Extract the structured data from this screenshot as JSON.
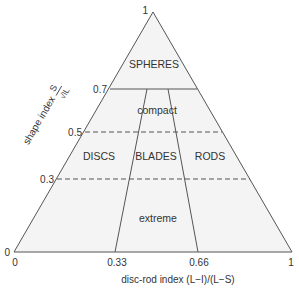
{
  "diagram": {
    "colors": {
      "fill": "#f4f4f4",
      "line": "#555555",
      "text": "#333333"
    },
    "apex_label": "1",
    "y_axis": {
      "label": "shape index",
      "fraction_num": "S",
      "fraction_den": "√IL",
      "ticks": [
        "0",
        "0.3",
        "0.5",
        "0.7",
        "1"
      ]
    },
    "x_axis": {
      "label": "disc-rod index (L−I)/(L−S)",
      "ticks": [
        "0",
        "0.33",
        "0.66",
        "1"
      ]
    },
    "regions": {
      "spheres": "SPHERES",
      "compact": "compact",
      "discs": "DISCS",
      "blades": "BLADES",
      "rods": "RODS",
      "extreme": "extreme"
    }
  }
}
